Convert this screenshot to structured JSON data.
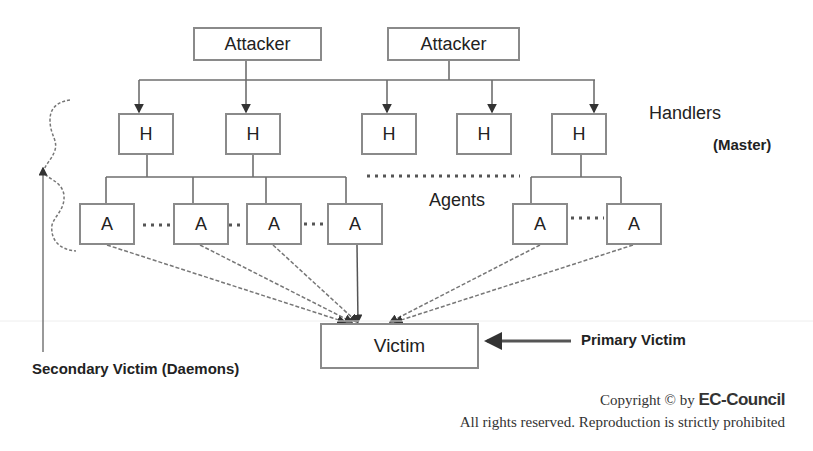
{
  "diagram": {
    "type": "DDoS attack hierarchy",
    "attackers": [
      {
        "id": "attacker-1",
        "label": "Attacker"
      },
      {
        "id": "attacker-2",
        "label": "Attacker"
      }
    ],
    "handlers": [
      {
        "id": "h1",
        "label": "H"
      },
      {
        "id": "h2",
        "label": "H"
      },
      {
        "id": "h3",
        "label": "H"
      },
      {
        "id": "h4",
        "label": "H"
      },
      {
        "id": "h5",
        "label": "H"
      }
    ],
    "agents": [
      {
        "id": "a1",
        "label": "A"
      },
      {
        "id": "a2",
        "label": "A"
      },
      {
        "id": "a3",
        "label": "A"
      },
      {
        "id": "a4",
        "label": "A"
      },
      {
        "id": "a5",
        "label": "A"
      },
      {
        "id": "a6",
        "label": "A"
      }
    ],
    "victim": {
      "label": "Victim"
    },
    "labels": {
      "handlers": "Handlers",
      "master": "(Master)",
      "agents": "Agents",
      "primary_victim": "Primary Victim",
      "secondary_victim": "Secondary Victim (Daemons)"
    },
    "edges": [
      {
        "from": "attacker-1",
        "to": "h1"
      },
      {
        "from": "attacker-1",
        "to": "h2"
      },
      {
        "from": "attacker-2",
        "to": "h3"
      },
      {
        "from": "attacker-2",
        "to": "h4"
      },
      {
        "from": "attacker-2",
        "to": "h5"
      },
      {
        "from": "h1",
        "to": "a1"
      },
      {
        "from": "h1",
        "to": "a2"
      },
      {
        "from": "h2",
        "to": "a3"
      },
      {
        "from": "h2",
        "to": "a4"
      },
      {
        "from": "h5",
        "to": "a5"
      },
      {
        "from": "h5",
        "to": "a6"
      },
      {
        "from": "a1",
        "to": "victim"
      },
      {
        "from": "a2",
        "to": "victim"
      },
      {
        "from": "a3",
        "to": "victim"
      },
      {
        "from": "a4",
        "to": "victim"
      },
      {
        "from": "a5",
        "to": "victim"
      },
      {
        "from": "a6",
        "to": "victim"
      }
    ]
  },
  "footer": {
    "copyright_prefix": "Copyright © by ",
    "brand": "EC-Council",
    "rights": "All rights reserved. Reproduction is strictly prohibited"
  },
  "colors": {
    "line": "#6e6e6e",
    "box_border": "#8a8a8a",
    "text": "#222222"
  }
}
